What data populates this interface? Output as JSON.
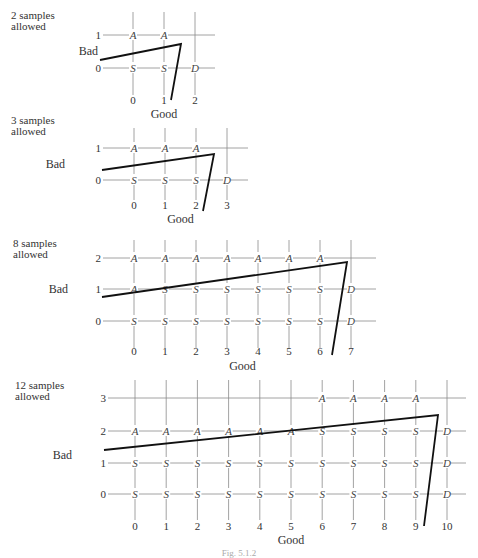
{
  "caption": "Fig. 5.1.2",
  "panels": [
    {
      "title": "2 samples\nallowed",
      "title_pos": [
        11,
        10
      ],
      "x0": 133,
      "dx": 31,
      "cols": 3,
      "row_y": [
        68,
        35
      ],
      "ylabel": "Bad",
      "ylabel_pos": [
        98,
        55
      ],
      "xlabel": "Good",
      "xlabel_y": 118,
      "tick_y": 104,
      "grid_top": 12,
      "grid_bottom": 95,
      "hline_left": 103,
      "hline_right": 215,
      "nodes": [
        [
          "S",
          "S",
          "D"
        ],
        [
          "A",
          "A",
          ""
        ]
      ],
      "path": [
        [
          100,
          60
        ],
        [
          181,
          44
        ],
        [
          171,
          100
        ]
      ]
    },
    {
      "title": "3 samples\nallowed",
      "title_pos": [
        11,
        115
      ],
      "x0": 134,
      "dx": 31,
      "cols": 4,
      "row_y": [
        180,
        148
      ],
      "ylabel": "Bad",
      "ylabel_pos": [
        65,
        168
      ],
      "xlabel": "Good",
      "xlabel_y": 223,
      "tick_y": 209,
      "grid_top": 128,
      "grid_bottom": 200,
      "hline_left": 103,
      "hline_right": 248,
      "nodes": [
        [
          "S",
          "S",
          "S",
          "D"
        ],
        [
          "A",
          "A",
          "A",
          ""
        ]
      ],
      "path": [
        [
          102,
          170
        ],
        [
          214,
          154
        ],
        [
          203,
          211
        ]
      ]
    },
    {
      "title": "8 samples\nallowed",
      "title_pos": [
        13,
        238
      ],
      "x0": 134,
      "dx": 31,
      "cols": 8,
      "row_y": [
        321,
        289,
        258
      ],
      "ylabel": "Bad",
      "ylabel_pos": [
        68,
        293
      ],
      "xlabel": "Good",
      "xlabel_y": 370,
      "tick_y": 355,
      "grid_top": 240,
      "grid_bottom": 348,
      "hline_left": 103,
      "hline_right": 376,
      "nodes": [
        [
          "S",
          "S",
          "S",
          "S",
          "S",
          "S",
          "S",
          "D"
        ],
        [
          "A",
          "S",
          "S",
          "S",
          "S",
          "S",
          "S",
          "D"
        ],
        [
          "A",
          "A",
          "A",
          "A",
          "A",
          "A",
          "A",
          ""
        ]
      ],
      "path": [
        [
          102,
          297
        ],
        [
          347,
          262
        ],
        [
          332,
          355
        ]
      ]
    },
    {
      "title": "12 samples\nallowed",
      "title_pos": [
        15,
        380
      ],
      "x0": 135,
      "dx": 31.2,
      "cols": 11,
      "row_y": [
        494,
        463,
        431,
        398
      ],
      "ylabel": "Bad",
      "ylabel_pos": [
        72,
        459
      ],
      "xlabel": "Good",
      "xlabel_y": 544,
      "tick_y": 530,
      "grid_top": 380,
      "grid_bottom": 520,
      "hline_left": 108,
      "hline_right": 466,
      "nodes": [
        [
          "S",
          "S",
          "S",
          "S",
          "S",
          "S",
          "S",
          "S",
          "S",
          "S",
          "D"
        ],
        [
          "S",
          "S",
          "S",
          "S",
          "S",
          "S",
          "S",
          "S",
          "S",
          "S",
          "D"
        ],
        [
          "A",
          "A",
          "A",
          "A",
          "A",
          "A",
          "S",
          "S",
          "S",
          "S",
          "D"
        ],
        [
          "",
          "",
          "",
          "",
          "",
          "",
          "A",
          "A",
          "A",
          "A",
          ""
        ]
      ],
      "path": [
        [
          104,
          450
        ],
        [
          438,
          415
        ],
        [
          424,
          526
        ]
      ]
    }
  ]
}
